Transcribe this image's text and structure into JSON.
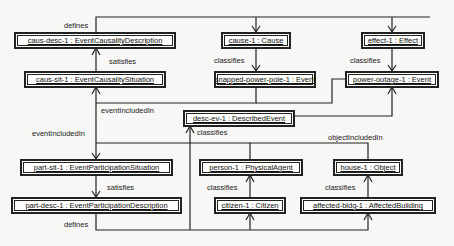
{
  "nodes": {
    "caus_desc": "caus-desc-1 : EventCausalityDescription",
    "caus_sit": "caus-sit-1 : EventCausalitySituation",
    "cause": "cause-1 : Cause",
    "effect": "effect-1 : Effect",
    "snapped": "snapped-power-pole-1 : Event",
    "outage": "power-outage-1 : Event",
    "desc_ev": "desc-ev-1 : DescribedEvent",
    "part_sit": "part-sit-1 : EventParticipationSituation",
    "part_desc": "part-desc-1 : EventParticipationDescription",
    "person": "person-1 : PhysicalAgent",
    "citizen": "citizen-1 : Citizen",
    "house": "house-1 : Object",
    "bldg": "affected-bldg-1 : AffectedBuilding"
  },
  "labels": {
    "defines_top": "defines",
    "satisfies_top": "satisfies",
    "classifies_cause": "classifies",
    "classifies_effect": "classifies",
    "eventincluded_top": "eventIncludedIn",
    "eventincluded_left": "eventIncludedIn",
    "classifies_desc": "classifies",
    "object_included": "objectIncludedIn",
    "satisfies_bottom": "satisfies",
    "classifies_person": "classifies",
    "classifies_house": "classifies",
    "defines_bottom": "defines"
  }
}
